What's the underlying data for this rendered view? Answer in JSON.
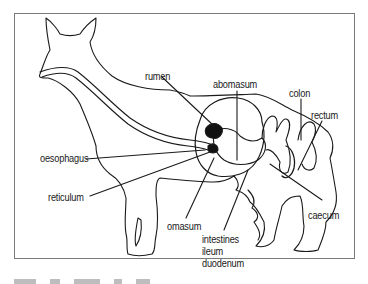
{
  "diagram": {
    "labels": {
      "rumen": "rumen",
      "abomasum": "abomasum",
      "colon": "colon",
      "rectum": "rectum",
      "oesophagus": "oesophagus",
      "reticulum": "reticulum",
      "omasum": "omasum",
      "intestines": "intestines",
      "ileum": "ileum",
      "duodenum": "duodenum",
      "caecum": "caecum"
    },
    "colors": {
      "line": "#1a1a1a",
      "frame": "#7a7a7a",
      "dark_fill": "#111111"
    }
  }
}
